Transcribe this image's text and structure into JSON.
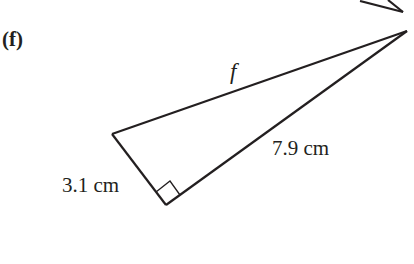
{
  "figure": {
    "part_label": "(f)",
    "triangle": {
      "type": "right triangle",
      "right_angle_at": "bottom vertex",
      "sides": {
        "hypotenuse_label": "f",
        "long_leg_label": "7.9 cm",
        "short_leg_label": "3.1 cm"
      }
    },
    "partial_previous_figure": "cut-off triangle corner at top-right"
  }
}
